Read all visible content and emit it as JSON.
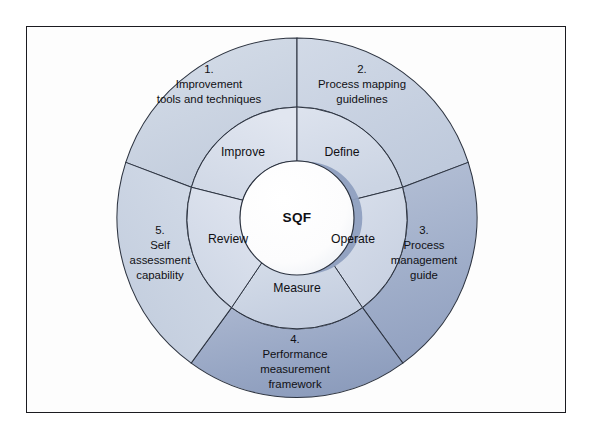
{
  "figure": {
    "kind": "concentric-ring-diagram",
    "hub": {
      "label": "SQF"
    },
    "inner_ring": {
      "segments": [
        {
          "id": "define",
          "label": "Define"
        },
        {
          "id": "operate",
          "label": "Operate"
        },
        {
          "id": "measure",
          "label": "Measure"
        },
        {
          "id": "review",
          "label": "Review"
        },
        {
          "id": "improve",
          "label": "Improve"
        }
      ]
    },
    "outer_ring": {
      "segments": [
        {
          "id": "outer-1",
          "number": "1.",
          "lines": [
            "Improvement",
            "tools and techniques"
          ]
        },
        {
          "id": "outer-2",
          "number": "2.",
          "lines": [
            "Process mapping",
            "guidelines"
          ]
        },
        {
          "id": "outer-3",
          "number": "3.",
          "lines": [
            "Process",
            "management",
            "guide"
          ]
        },
        {
          "id": "outer-4",
          "number": "4.",
          "lines": [
            "Performance",
            "measurement",
            "framework"
          ]
        },
        {
          "id": "outer-5",
          "number": "5.",
          "lines": [
            "Self",
            "assessment",
            "capability"
          ]
        }
      ]
    },
    "colors": {
      "outer_light": "#ccd5e4",
      "outer_mid": "#c3cedf",
      "outer_dark": "#9aa8c4",
      "outer_darker": "#8e9dbb",
      "inner_light": "#d4dcea",
      "inner_mid": "#c9d2e3",
      "hub_fill": "#fdfdfd",
      "hub_shadow": "#8fa0c0",
      "stroke": "#2c3340",
      "frame_border": "#1b1b20",
      "background": "#ffffff",
      "text": "#101014"
    }
  }
}
